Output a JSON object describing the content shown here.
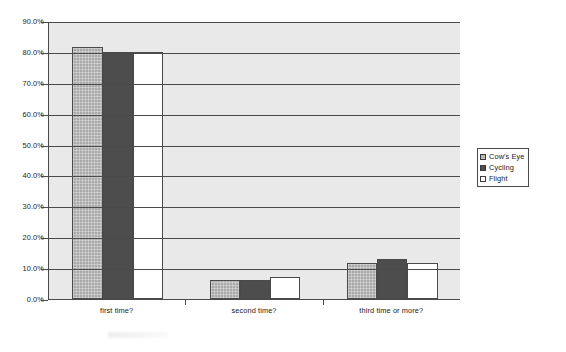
{
  "chart_data": {
    "type": "bar",
    "title": "",
    "xlabel": "",
    "ylabel": "",
    "categories": [
      "first time?",
      "second time?",
      "third time or more?"
    ],
    "series": [
      {
        "name": "Cow's Eye",
        "color": "#a9a9a9",
        "values": [
          81.5,
          6.3,
          11.5
        ]
      },
      {
        "name": "Cycling",
        "color": "#4d4d4d",
        "values": [
          80.0,
          6.0,
          13.0
        ]
      },
      {
        "name": "Flight",
        "color": "#ffffff",
        "values": [
          80.0,
          7.0,
          11.5
        ]
      }
    ],
    "ylim": [
      0,
      90
    ],
    "ytick_values": [
      0,
      10,
      20,
      30,
      40,
      50,
      60,
      70,
      80,
      90
    ],
    "ytick_labels": [
      "0.0%",
      "10.0%",
      "20.0%",
      "30.0%",
      "40.0%",
      "50.0%",
      "60.0%",
      "70.0%",
      "80.0%",
      "90.0%"
    ],
    "grid": true,
    "legend_position": "right",
    "plot_background": "#e9e9e9",
    "axis_color": "#4a4a4a"
  },
  "legend": {
    "items": [
      {
        "label": "Cow's Eye"
      },
      {
        "label": "Cycling"
      },
      {
        "label": "Flight"
      }
    ]
  }
}
